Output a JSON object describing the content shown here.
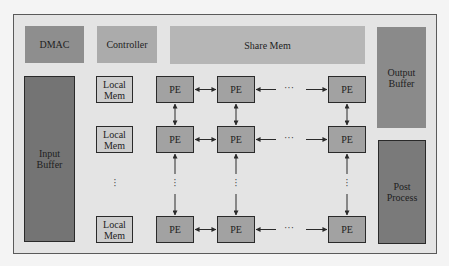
{
  "diagram": {
    "top_row": {
      "dmac": "DMAC",
      "controller": "Controller",
      "share_mem": "Share Mem"
    },
    "output_buffer": "Output Buffer",
    "input_buffer": "Input Buffer",
    "post_process": "Post Process",
    "local_mem": [
      "Local Mem",
      "Local Mem",
      "Local Mem"
    ],
    "pe_label": "PE",
    "pe_grid": {
      "rows": [
        [
          "PE",
          "PE",
          "PE"
        ],
        [
          "PE",
          "PE",
          "PE"
        ],
        [
          "PE",
          "PE",
          "PE"
        ]
      ]
    },
    "ellipsis_h": "···",
    "ellipsis_v": "⋮",
    "colors": {
      "frame_bg": "#e4e4e4",
      "dmac": "#8e8e8e",
      "controller": "#ababab",
      "share_mem": "#b6b6b6",
      "output_buffer": "#8a8a8a",
      "input_buffer": "#747474",
      "post_process": "#7a7a7a",
      "local_mem": "#cdcdcd",
      "pe": "#a2a2a2"
    }
  }
}
